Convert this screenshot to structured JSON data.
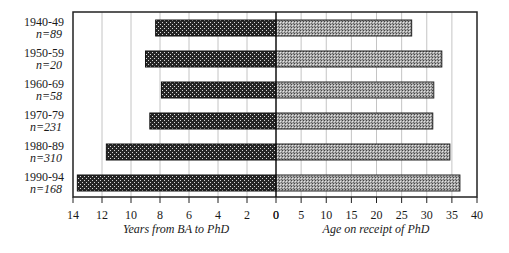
{
  "chart_data": {
    "type": "bar",
    "orientation": "horizontal",
    "layout": "back-to-back (two panels sharing category axis)",
    "categories": [
      "1940-49",
      "1950-59",
      "1960-69",
      "1970-79",
      "1980-89",
      "1990-94"
    ],
    "sample_sizes": [
      "n=89",
      "n=20",
      "n=58",
      "n=231",
      "n=310",
      "n=168"
    ],
    "series": [
      {
        "name": "Years from BA to PhD",
        "panel": "left",
        "values": [
          8.3,
          9.0,
          7.9,
          8.7,
          11.7,
          13.7
        ],
        "fill": "dark stipple",
        "color": "#2a2a2a"
      },
      {
        "name": "Age on receipt of PhD",
        "panel": "right",
        "values": [
          27.0,
          33.0,
          31.4,
          31.2,
          34.6,
          36.6
        ],
        "fill": "light stipple",
        "color": "#9a9a9a"
      }
    ],
    "left_axis": {
      "label": "Years from BA to PhD",
      "ticks": [
        "14",
        "12",
        "10",
        "8",
        "6",
        "4",
        "2",
        "0"
      ],
      "range": [
        14,
        0
      ],
      "reversed": true
    },
    "right_axis": {
      "label": "Age on receipt of PhD",
      "ticks": [
        "0",
        "5",
        "10",
        "15",
        "20",
        "25",
        "30",
        "35",
        "40"
      ],
      "range": [
        0,
        40
      ]
    },
    "grid": "vertical gridlines at each tick",
    "legend": "none",
    "title": ""
  },
  "rows": [
    {
      "period": "1940-49",
      "n": "n=89"
    },
    {
      "period": "1950-59",
      "n": "n=20"
    },
    {
      "period": "1960-69",
      "n": "n=58"
    },
    {
      "period": "1970-79",
      "n": "n=231"
    },
    {
      "period": "1980-89",
      "n": "n=310"
    },
    {
      "period": "1990-94",
      "n": "n=168"
    }
  ],
  "left_ticks": [
    "14",
    "12",
    "10",
    "8",
    "6",
    "4",
    "2",
    "0"
  ],
  "right_ticks": [
    "0",
    "5",
    "10",
    "15",
    "20",
    "25",
    "30",
    "35",
    "40"
  ],
  "left_axis_title": "Years from BA to PhD",
  "right_axis_title": "Age on receipt of PhD"
}
